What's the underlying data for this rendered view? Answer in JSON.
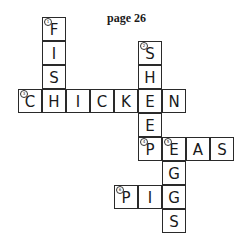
{
  "title": "page 26",
  "grid": {
    "cell_size": 24,
    "origin_x": 18,
    "origin_y": 17
  },
  "words": [
    {
      "number": "1",
      "answer": "FISH",
      "direction": "down",
      "col": 1,
      "row": 0
    },
    {
      "number": "2",
      "answer": "SHEEP",
      "direction": "down",
      "col": 5,
      "row": 1
    },
    {
      "number": "3",
      "answer": "CHICKEN",
      "direction": "across",
      "col": 0,
      "row": 3
    },
    {
      "number": "4",
      "answer": "PEAS",
      "direction": "across",
      "col": 5,
      "row": 5
    },
    {
      "number": "5",
      "answer": "EGGS",
      "direction": "down",
      "col": 6,
      "row": 5
    },
    {
      "number": "6",
      "answer": "PIGS",
      "direction": "across",
      "col": 4,
      "row": 7
    }
  ],
  "cells": [
    {
      "col": 1,
      "row": 0,
      "letter": "F",
      "number": "1"
    },
    {
      "col": 1,
      "row": 1,
      "letter": "I"
    },
    {
      "col": 1,
      "row": 2,
      "letter": "S"
    },
    {
      "col": 5,
      "row": 1,
      "letter": "S",
      "number": "2"
    },
    {
      "col": 5,
      "row": 2,
      "letter": "H"
    },
    {
      "col": 0,
      "row": 3,
      "letter": "C",
      "number": "3"
    },
    {
      "col": 1,
      "row": 3,
      "letter": "H"
    },
    {
      "col": 2,
      "row": 3,
      "letter": "I"
    },
    {
      "col": 3,
      "row": 3,
      "letter": "C"
    },
    {
      "col": 4,
      "row": 3,
      "letter": "K"
    },
    {
      "col": 5,
      "row": 3,
      "letter": "E"
    },
    {
      "col": 6,
      "row": 3,
      "letter": "N"
    },
    {
      "col": 5,
      "row": 4,
      "letter": "E"
    },
    {
      "col": 5,
      "row": 5,
      "letter": "P",
      "number": "4"
    },
    {
      "col": 6,
      "row": 5,
      "letter": "E",
      "number": "5"
    },
    {
      "col": 7,
      "row": 5,
      "letter": "A"
    },
    {
      "col": 8,
      "row": 5,
      "letter": "S"
    },
    {
      "col": 6,
      "row": 6,
      "letter": "G"
    },
    {
      "col": 4,
      "row": 7,
      "letter": "P",
      "number": "6"
    },
    {
      "col": 5,
      "row": 7,
      "letter": "I"
    },
    {
      "col": 6,
      "row": 7,
      "letter": "G"
    },
    {
      "col": 6,
      "row": 8,
      "letter": "S"
    }
  ]
}
